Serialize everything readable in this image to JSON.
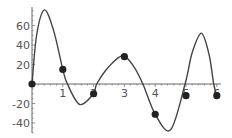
{
  "chart_data": {
    "type": "line",
    "title": "",
    "xlabel": "",
    "ylabel": "",
    "xlim": [
      0,
      6
    ],
    "ylim": [
      -50,
      78
    ],
    "grid": false,
    "legend": null,
    "x_ticks": [
      1,
      2,
      3,
      4,
      5,
      6
    ],
    "x_tick_labels": [
      "1",
      "2",
      "3",
      "4",
      "5",
      "6"
    ],
    "y_ticks": [
      60,
      40,
      20,
      -20,
      -40
    ],
    "y_tick_labels": [
      "60",
      "40",
      "20",
      "-20",
      "-40"
    ],
    "series": [
      {
        "name": "interpolating curve",
        "kind": "line",
        "x": [
          0,
          0.15,
          0.4,
          0.7,
          1,
          1.15,
          1.55,
          2,
          2.1,
          2.5,
          2.95,
          3.3,
          3.6,
          4,
          4.5,
          4.97,
          5.2,
          5.5,
          5.75,
          5.9,
          6
        ],
        "y": [
          0,
          50,
          76,
          55,
          15,
          0,
          -21,
          -10,
          0,
          18,
          29,
          18,
          0,
          -31,
          -47,
          0,
          32,
          52,
          30,
          0,
          -12
        ]
      },
      {
        "name": "data points",
        "kind": "scatter",
        "x": [
          0,
          1,
          2,
          3,
          4,
          5,
          6
        ],
        "y": [
          0,
          15,
          -10,
          28,
          -31,
          -12,
          -12
        ]
      }
    ]
  }
}
